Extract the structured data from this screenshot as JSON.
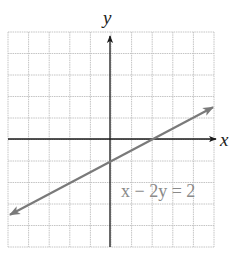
{
  "chart_data": {
    "type": "line",
    "title": "",
    "xlabel": "x",
    "ylabel": "y",
    "xlim": [
      -5,
      5
    ],
    "ylim": [
      -5,
      5
    ],
    "grid": true,
    "grid_step": 1,
    "series": [
      {
        "name": "x − 2y = 2",
        "equation": "x - 2y = 2",
        "slope": 0.5,
        "y_intercept": -1,
        "x_intercept": 2,
        "x": [
          -5,
          5
        ],
        "y": [
          -3.5,
          1.5
        ],
        "color": "#7a7a7a"
      }
    ],
    "annotations": [
      {
        "text": "x − 2y = 2",
        "x": 1.3,
        "y": -2.7
      }
    ]
  },
  "labels": {
    "x_axis": "x",
    "y_axis": "y",
    "equation": "x − 2y = 2"
  },
  "colors": {
    "grid": "#c4c4c4",
    "axis": "#1a1a1a",
    "line": "#7a7a7a",
    "label": "#8a8a8a"
  }
}
